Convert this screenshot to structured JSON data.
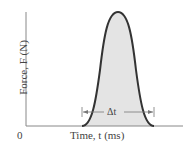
{
  "figure": {
    "type": "force-time pulse diagram",
    "y_axis_label": "Force, F (N)",
    "x_axis_label": "Time, t (ms)",
    "origin_label": "0",
    "interval_label": "Δt",
    "colors": {
      "curve": "#333333",
      "fill": "#e4e4e4",
      "axes": "#888888",
      "text": "#444444"
    }
  }
}
